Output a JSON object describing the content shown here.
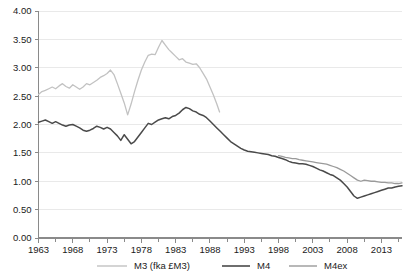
{
  "chart_data": {
    "type": "line",
    "title": "",
    "xlabel": "",
    "ylabel": "",
    "xlim": [
      1963,
      2016
    ],
    "ylim": [
      0.0,
      4.0
    ],
    "grid": true,
    "legend_position": "bottom",
    "y_ticks": [
      "0.00",
      "0.50",
      "1.00",
      "1.50",
      "2.00",
      "2.50",
      "3.00",
      "3.50",
      "4.00"
    ],
    "y_tick_values": [
      0.0,
      0.5,
      1.0,
      1.5,
      2.0,
      2.5,
      3.0,
      3.5,
      4.0
    ],
    "x_ticks": [
      "1963",
      "1968",
      "1973",
      "1978",
      "1983",
      "1988",
      "1993",
      "1998",
      "2003",
      "2008",
      "2013"
    ],
    "x_tick_values": [
      1963,
      1968,
      1973,
      1978,
      1983,
      1988,
      1993,
      1998,
      2003,
      2008,
      2013
    ],
    "x_minor_step": 1,
    "colors": {
      "m3": "#c2c2c2",
      "m4": "#4a4a4a",
      "m4ex": "#9a9a9a"
    },
    "series": [
      {
        "name": "M3 (fka £M3)",
        "key": "m3",
        "color": "#c2c2c2",
        "x": [
          1963.0,
          1963.5,
          1964.0,
          1964.5,
          1965.0,
          1965.5,
          1966.0,
          1966.5,
          1967.0,
          1967.5,
          1968.0,
          1968.5,
          1969.0,
          1969.5,
          1970.0,
          1970.5,
          1971.0,
          1971.5,
          1972.0,
          1972.5,
          1973.0,
          1973.5,
          1974.0,
          1974.5,
          1975.0,
          1975.5,
          1976.0,
          1976.5,
          1977.0,
          1977.5,
          1978.0,
          1978.5,
          1979.0,
          1979.5,
          1980.0,
          1980.5,
          1981.0,
          1981.5,
          1982.0,
          1982.5,
          1983.0,
          1983.5,
          1984.0,
          1984.5,
          1985.0,
          1985.5,
          1986.0,
          1986.5,
          1987.0,
          1987.5,
          1988.0,
          1988.5,
          1989.0,
          1989.4
        ],
        "values": [
          2.53,
          2.58,
          2.6,
          2.63,
          2.66,
          2.63,
          2.68,
          2.72,
          2.67,
          2.64,
          2.7,
          2.66,
          2.62,
          2.66,
          2.72,
          2.7,
          2.74,
          2.78,
          2.83,
          2.86,
          2.9,
          2.96,
          2.88,
          2.72,
          2.55,
          2.38,
          2.17,
          2.36,
          2.58,
          2.78,
          2.96,
          3.1,
          3.22,
          3.24,
          3.23,
          3.36,
          3.48,
          3.4,
          3.32,
          3.26,
          3.2,
          3.14,
          3.16,
          3.1,
          3.08,
          3.06,
          3.07,
          3.0,
          2.9,
          2.8,
          2.66,
          2.52,
          2.36,
          2.22
        ]
      },
      {
        "name": "M4",
        "key": "m4",
        "color": "#4a4a4a",
        "x": [
          1963.0,
          1963.5,
          1964.0,
          1964.5,
          1965.0,
          1965.5,
          1966.0,
          1966.5,
          1967.0,
          1967.5,
          1968.0,
          1968.5,
          1969.0,
          1969.5,
          1970.0,
          1970.5,
          1971.0,
          1971.5,
          1972.0,
          1972.5,
          1973.0,
          1973.5,
          1974.0,
          1974.5,
          1975.0,
          1975.5,
          1976.0,
          1976.5,
          1977.0,
          1977.5,
          1978.0,
          1978.5,
          1979.0,
          1979.5,
          1980.0,
          1980.5,
          1981.0,
          1981.5,
          1982.0,
          1982.5,
          1983.0,
          1983.5,
          1984.0,
          1984.5,
          1985.0,
          1985.5,
          1986.0,
          1986.5,
          1987.0,
          1987.5,
          1988.0,
          1988.5,
          1989.0,
          1989.5,
          1990.0,
          1990.5,
          1991.0,
          1991.5,
          1992.0,
          1992.5,
          1993.0,
          1993.5,
          1994.0,
          1994.5,
          1995.0,
          1995.5,
          1996.0,
          1996.5,
          1997.0,
          1997.5,
          1998.0,
          1998.5,
          1999.0,
          1999.5,
          2000.0,
          2000.5,
          2001.0,
          2001.5,
          2002.0,
          2002.5,
          2003.0,
          2003.5,
          2004.0,
          2004.5,
          2005.0,
          2005.5,
          2006.0,
          2006.5,
          2007.0,
          2007.5,
          2008.0,
          2008.5,
          2009.0,
          2009.5,
          2010.0,
          2010.5,
          2011.0,
          2011.5,
          2012.0,
          2012.5,
          2013.0,
          2013.5,
          2014.0,
          2014.5,
          2015.0,
          2015.5,
          2016.0
        ],
        "values": [
          2.04,
          2.06,
          2.08,
          2.05,
          2.02,
          2.05,
          2.02,
          1.99,
          1.97,
          1.99,
          2.0,
          1.97,
          1.94,
          1.9,
          1.88,
          1.9,
          1.93,
          1.97,
          1.95,
          1.92,
          1.95,
          1.92,
          1.86,
          1.8,
          1.72,
          1.82,
          1.74,
          1.66,
          1.7,
          1.78,
          1.86,
          1.94,
          2.02,
          2.0,
          2.04,
          2.08,
          2.1,
          2.12,
          2.1,
          2.14,
          2.16,
          2.2,
          2.26,
          2.3,
          2.28,
          2.24,
          2.22,
          2.18,
          2.16,
          2.12,
          2.06,
          2.0,
          1.94,
          1.88,
          1.82,
          1.76,
          1.7,
          1.66,
          1.62,
          1.58,
          1.55,
          1.53,
          1.52,
          1.51,
          1.5,
          1.49,
          1.48,
          1.47,
          1.45,
          1.44,
          1.42,
          1.4,
          1.38,
          1.35,
          1.33,
          1.32,
          1.31,
          1.31,
          1.3,
          1.28,
          1.26,
          1.23,
          1.2,
          1.18,
          1.15,
          1.12,
          1.1,
          1.06,
          1.02,
          0.96,
          0.9,
          0.82,
          0.74,
          0.7,
          0.72,
          0.74,
          0.76,
          0.78,
          0.8,
          0.82,
          0.84,
          0.86,
          0.88,
          0.88,
          0.9,
          0.91,
          0.92
        ]
      },
      {
        "name": "M4ex",
        "key": "m4ex",
        "color": "#9a9a9a",
        "x": [
          1998.0,
          1998.5,
          1999.0,
          1999.5,
          2000.0,
          2000.5,
          2001.0,
          2001.5,
          2002.0,
          2002.5,
          2003.0,
          2003.5,
          2004.0,
          2004.5,
          2005.0,
          2005.5,
          2006.0,
          2006.5,
          2007.0,
          2007.5,
          2008.0,
          2008.5,
          2009.0,
          2009.5,
          2010.0,
          2010.5,
          2011.0,
          2011.5,
          2012.0,
          2012.5,
          2013.0,
          2013.5,
          2014.0,
          2014.5,
          2015.0,
          2015.5,
          2016.0
        ],
        "values": [
          1.45,
          1.44,
          1.42,
          1.41,
          1.4,
          1.4,
          1.38,
          1.37,
          1.36,
          1.35,
          1.34,
          1.33,
          1.32,
          1.31,
          1.3,
          1.28,
          1.26,
          1.24,
          1.21,
          1.18,
          1.14,
          1.1,
          1.06,
          1.02,
          1.0,
          1.02,
          1.01,
          1.0,
          1.0,
          0.99,
          0.98,
          0.98,
          0.97,
          0.97,
          0.96,
          0.96,
          0.97
        ]
      }
    ]
  },
  "legend": {
    "items": [
      {
        "label": "M3 (fka £M3)",
        "key": "m3"
      },
      {
        "label": "M4",
        "key": "m4"
      },
      {
        "label": "M4ex",
        "key": "m4ex"
      }
    ]
  }
}
